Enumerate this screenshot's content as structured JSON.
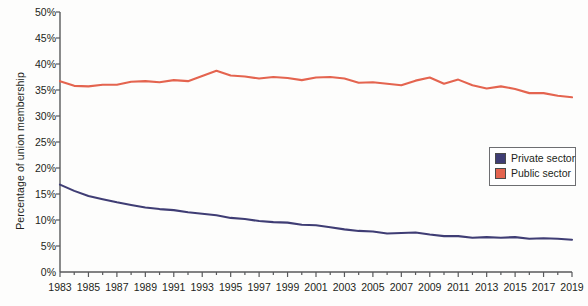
{
  "chart_data": {
    "type": "line",
    "title": "",
    "xlabel": "",
    "ylabel": "Percentage of union membership",
    "ylim": [
      0,
      50
    ],
    "xlim": [
      1983,
      2019
    ],
    "grid": false,
    "legend_position": "right-middle",
    "ytick_labels": [
      "50%",
      "45%",
      "40%",
      "35%",
      "30%",
      "25%",
      "20%",
      "15%",
      "10%",
      "5%",
      "0%"
    ],
    "ytick_values": [
      50,
      45,
      40,
      35,
      30,
      25,
      20,
      15,
      10,
      5,
      0
    ],
    "xtick_labels": [
      "1983",
      "1985",
      "1987",
      "1989",
      "1991",
      "1993",
      "1995",
      "1997",
      "1999",
      "2001",
      "2003",
      "2005",
      "2007",
      "2009",
      "2011",
      "2013",
      "2015",
      "2017",
      "2019"
    ],
    "xtick_values": [
      1983,
      1985,
      1987,
      1989,
      1991,
      1993,
      1995,
      1997,
      1999,
      2001,
      2003,
      2005,
      2007,
      2009,
      2011,
      2013,
      2015,
      2017,
      2019
    ],
    "x": [
      1983,
      1984,
      1985,
      1986,
      1987,
      1988,
      1989,
      1990,
      1991,
      1992,
      1993,
      1994,
      1995,
      1996,
      1997,
      1998,
      1999,
      2000,
      2001,
      2002,
      2003,
      2004,
      2005,
      2006,
      2007,
      2008,
      2009,
      2010,
      2011,
      2012,
      2013,
      2014,
      2015,
      2016,
      2017,
      2018,
      2019
    ],
    "series": [
      {
        "name": "Private sector",
        "color": "#3f3d74",
        "values": [
          16.8,
          15.6,
          14.6,
          14.0,
          13.4,
          12.9,
          12.4,
          12.1,
          11.9,
          11.5,
          11.2,
          10.9,
          10.4,
          10.2,
          9.8,
          9.6,
          9.5,
          9.1,
          9.0,
          8.6,
          8.2,
          7.9,
          7.8,
          7.4,
          7.5,
          7.6,
          7.2,
          6.9,
          6.9,
          6.6,
          6.7,
          6.6,
          6.7,
          6.4,
          6.5,
          6.4,
          6.2
        ]
      },
      {
        "name": "Public sector",
        "color": "#e4644f",
        "values": [
          36.7,
          35.8,
          35.7,
          36.0,
          36.0,
          36.6,
          36.7,
          36.5,
          36.9,
          36.7,
          37.7,
          38.7,
          37.8,
          37.6,
          37.2,
          37.5,
          37.3,
          36.9,
          37.4,
          37.5,
          37.2,
          36.4,
          36.5,
          36.2,
          35.9,
          36.8,
          37.4,
          36.2,
          37.0,
          35.9,
          35.3,
          35.7,
          35.2,
          34.4,
          34.4,
          33.9,
          33.6
        ]
      }
    ]
  },
  "legend": {
    "items": [
      {
        "label": "Private sector",
        "color": "#3f3d74"
      },
      {
        "label": "Public sector",
        "color": "#e4644f"
      }
    ]
  },
  "axes": {
    "y_title": "Percentage of union membership",
    "axis_color": "#58595b"
  }
}
